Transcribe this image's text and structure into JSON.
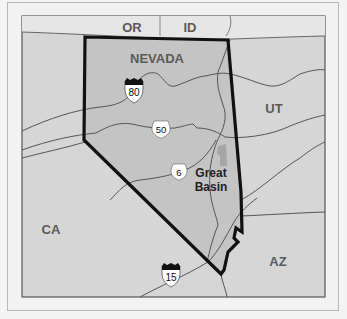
{
  "map": {
    "title": "Nevada and Great Basin locator map",
    "colors": {
      "outside_state": "#d6d6d6",
      "north_band": "#e8e8e8",
      "state_fill": "#c4c4c4",
      "state_border": "#111111",
      "road": "#555555",
      "label_gray": "#5a5a5a",
      "label_dark": "#222222",
      "park": "#a8a8a8"
    },
    "labels": {
      "state": "NEVADA",
      "neighbors": {
        "or": "OR",
        "id": "ID",
        "ut": "UT",
        "ca": "CA",
        "az": "AZ"
      },
      "park_line1": "Great",
      "park_line2": "Basin"
    },
    "shields": {
      "i80": "80",
      "us50": "50",
      "us6": "6",
      "i15": "15"
    }
  }
}
